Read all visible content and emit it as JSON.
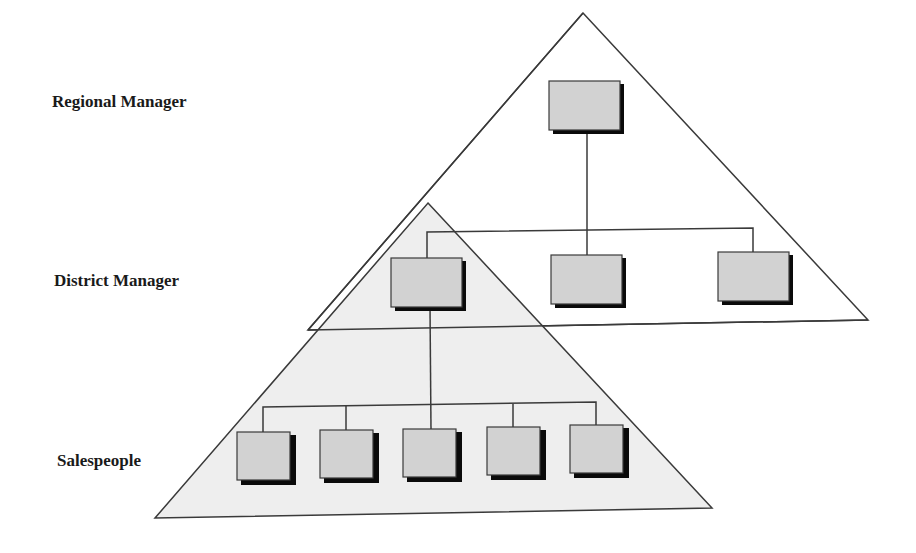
{
  "diagram": {
    "type": "hierarchy",
    "levels": [
      {
        "label": "Regional Manager",
        "count": 1
      },
      {
        "label": "District Manager",
        "count": 3
      },
      {
        "label": "Salespeople",
        "count": 5
      }
    ],
    "colors": {
      "line": "#3a3a3a",
      "box_fill": "#d2d2d2",
      "box_shadow": "#0a0a0a",
      "lower_triangle_fill": "#eeeeee",
      "upper_triangle_fill": "#ffffff",
      "label": "#1a1a1a"
    }
  },
  "labels": {
    "regional": "Regional Manager",
    "district": "District Manager",
    "sales": "Salespeople"
  }
}
